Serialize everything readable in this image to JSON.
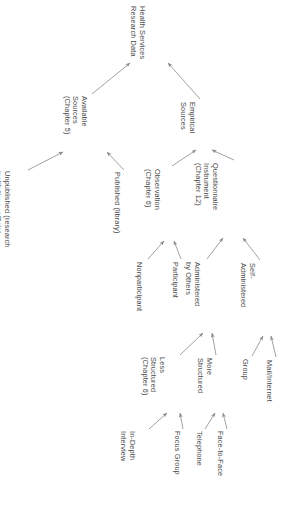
{
  "diagram": {
    "orientation": "rotated-90-clockwise",
    "line_color": "#8a8a8a",
    "text_color": "#4a4a4a",
    "background": "#ffffff",
    "nodes": [
      {
        "id": "root",
        "lines": [
          "Health Services",
          "Research Data"
        ],
        "x": 146,
        "y": 6,
        "lineCount": 2
      },
      {
        "id": "available",
        "lines": [
          "Available",
          "Sources",
          "(Chapter 5)"
        ],
        "x": 88,
        "y": 96,
        "lineCount": 3
      },
      {
        "id": "empirical",
        "lines": [
          "Empirical",
          "Sources"
        ],
        "x": 196,
        "y": 102,
        "lineCount": 2
      },
      {
        "id": "unpublished",
        "lines": [
          "Unpublished (research",
          "institutions, official",
          "documents, researchers)"
        ],
        "x": 11,
        "y": 171,
        "lineCount": 3
      },
      {
        "id": "published",
        "lines": [
          "Published (library)"
        ],
        "x": 121,
        "y": 172,
        "lineCount": 1
      },
      {
        "id": "observation",
        "lines": [
          "Observation",
          "(Chapter 6)"
        ],
        "x": 161,
        "y": 169,
        "lineCount": 2
      },
      {
        "id": "questionnaire",
        "lines": [
          "Questionnaire",
          "Instrument",
          "(Chapter 12)"
        ],
        "x": 219,
        "y": 163,
        "lineCount": 3
      },
      {
        "id": "nonparticipant",
        "lines": [
          "Nonparticipant"
        ],
        "x": 143,
        "y": 262,
        "lineCount": 1
      },
      {
        "id": "participant",
        "lines": [
          "Participant"
        ],
        "x": 179,
        "y": 262,
        "lineCount": 1
      },
      {
        "id": "admin-others",
        "lines": [
          "Administered",
          "by Others"
        ],
        "x": 201,
        "y": 262,
        "lineCount": 2
      },
      {
        "id": "self-admin",
        "lines": [
          "Self-",
          "Administered"
        ],
        "x": 256,
        "y": 263,
        "lineCount": 2
      },
      {
        "id": "less-structured",
        "lines": [
          "Less",
          "Structured",
          "(Chapter 6)"
        ],
        "x": 166,
        "y": 357,
        "lineCount": 3
      },
      {
        "id": "more-structured",
        "lines": [
          "More",
          "Structured"
        ],
        "x": 213,
        "y": 358,
        "lineCount": 2
      },
      {
        "id": "group",
        "lines": [
          "Group"
        ],
        "x": 249,
        "y": 359,
        "lineCount": 1
      },
      {
        "id": "mail-internet",
        "lines": [
          "Mail/Internet"
        ],
        "x": 273,
        "y": 360,
        "lineCount": 1
      },
      {
        "id": "in-depth",
        "lines": [
          "In-Depth",
          "Interview"
        ],
        "x": 136,
        "y": 431,
        "lineCount": 2
      },
      {
        "id": "focus-group",
        "lines": [
          "Focus Group"
        ],
        "x": 181,
        "y": 431,
        "lineCount": 1
      },
      {
        "id": "telephone",
        "lines": [
          "Telephone"
        ],
        "x": 203,
        "y": 431,
        "lineCount": 1
      },
      {
        "id": "face-to-face",
        "lines": [
          "Face-to-Face"
        ],
        "x": 224,
        "y": 431,
        "lineCount": 1
      }
    ],
    "edges": [
      {
        "id": "available-to-root",
        "from": "available",
        "to": "root",
        "x1": 92,
        "y1": 94,
        "x2": 130,
        "y2": 63
      },
      {
        "id": "empirical-to-root",
        "from": "empirical",
        "to": "root",
        "x1": 200,
        "y1": 99,
        "x2": 168,
        "y2": 63
      },
      {
        "id": "unpublished-to-available",
        "from": "unpublished",
        "to": "available",
        "x1": 28,
        "y1": 170,
        "x2": 63,
        "y2": 152
      },
      {
        "id": "published-to-available",
        "from": "published",
        "to": "available",
        "x1": 124,
        "y1": 170,
        "x2": 107,
        "y2": 152
      },
      {
        "id": "observation-to-empirical",
        "from": "observation",
        "to": "empirical",
        "x1": 172,
        "y1": 166,
        "x2": 196,
        "y2": 150
      },
      {
        "id": "questionnaire-to-empirical",
        "from": "questionnaire",
        "to": "empirical",
        "x1": 234,
        "y1": 160,
        "x2": 212,
        "y2": 150
      },
      {
        "id": "nonparticipant-to-observation",
        "from": "nonparticipant",
        "to": "observation",
        "x1": 148,
        "y1": 259,
        "x2": 164,
        "y2": 241
      },
      {
        "id": "participant-to-observation",
        "from": "participant",
        "to": "observation",
        "x1": 181,
        "y1": 259,
        "x2": 174,
        "y2": 241
      },
      {
        "id": "admin-others-to-quest",
        "from": "admin-others",
        "to": "questionnaire",
        "x1": 207,
        "y1": 259,
        "x2": 223,
        "y2": 238
      },
      {
        "id": "self-admin-to-quest",
        "from": "self-admin",
        "to": "questionnaire",
        "x1": 260,
        "y1": 260,
        "x2": 243,
        "y2": 238
      },
      {
        "id": "less-to-admin-others",
        "from": "less-structured",
        "to": "admin-others",
        "x1": 180,
        "y1": 355,
        "x2": 203,
        "y2": 333
      },
      {
        "id": "more-to-admin-others",
        "from": "more-structured",
        "to": "admin-others",
        "x1": 216,
        "y1": 355,
        "x2": 212,
        "y2": 333
      },
      {
        "id": "group-to-self-admin",
        "from": "group",
        "to": "self-admin",
        "x1": 252,
        "y1": 356,
        "x2": 263,
        "y2": 336
      },
      {
        "id": "mail-to-self-admin",
        "from": "mail-internet",
        "to": "self-admin",
        "x1": 276,
        "y1": 357,
        "x2": 271,
        "y2": 336
      },
      {
        "id": "indepth-to-less",
        "from": "in-depth",
        "to": "less-structured",
        "x1": 149,
        "y1": 429,
        "x2": 167,
        "y2": 413
      },
      {
        "id": "focus-to-less",
        "from": "focus-group",
        "to": "less-structured",
        "x1": 183,
        "y1": 429,
        "x2": 180,
        "y2": 413
      },
      {
        "id": "telephone-to-more",
        "from": "telephone",
        "to": "more-structured",
        "x1": 205,
        "y1": 429,
        "x2": 215,
        "y2": 413
      },
      {
        "id": "face-to-more",
        "from": "face-to-face",
        "to": "more-structured",
        "x1": 227,
        "y1": 429,
        "x2": 223,
        "y2": 413
      }
    ]
  }
}
